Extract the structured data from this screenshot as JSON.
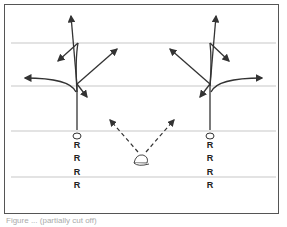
{
  "diagram": {
    "type": "football-route-diagram",
    "yard_lines": [
      43,
      86,
      131,
      177
    ],
    "receivers_left": {
      "x": 77,
      "labels": [
        "R",
        "R",
        "R",
        "R"
      ]
    },
    "receivers_right": {
      "x": 210,
      "labels": [
        "R",
        "R",
        "R",
        "R"
      ]
    },
    "ball_icon": "football-helmet-icon",
    "colors": {
      "line": "#cccccc",
      "route": "#333333",
      "frame": "#555555"
    }
  },
  "caption": "Figure ... (partially cut off)"
}
